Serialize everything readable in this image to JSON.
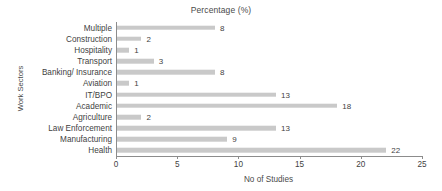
{
  "chart_data": {
    "type": "bar",
    "orientation": "horizontal",
    "title": "Percentage (%)",
    "xlabel": "No of Studies",
    "ylabel": "Work Sectors",
    "categories": [
      "Multiple",
      "Construction",
      "Hospitality",
      "Transport",
      "Banking/ Insurance",
      "Aviation",
      "IT/BPO",
      "Academic",
      "Agriculture",
      "Law Enforcement",
      "Manufacturing",
      "Health"
    ],
    "values": [
      8,
      2,
      1,
      3,
      8,
      1,
      13,
      18,
      2,
      13,
      9,
      22
    ],
    "xlim": [
      0,
      25
    ],
    "xticks": [
      0,
      5,
      10,
      15,
      20,
      25
    ],
    "xtick_labels": [
      "0",
      "5",
      "10",
      "15",
      "20",
      "25"
    ],
    "grid": false,
    "legend": null,
    "bar_color": "#c9c9c9",
    "axis_color": "#8c8c8c",
    "text_color": "#3f3f3f",
    "background": "#ffffff",
    "data_labels": [
      "8",
      "2",
      "1",
      "3",
      "8",
      "1",
      "13",
      "18",
      "2",
      "13",
      "9",
      "22"
    ]
  }
}
